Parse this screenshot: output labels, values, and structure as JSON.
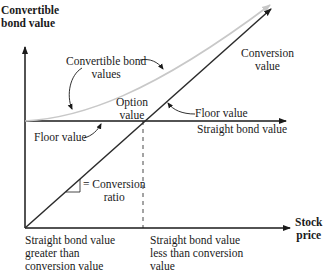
{
  "diagram": {
    "y_axis_label_line1": "Convertible",
    "y_axis_label_line2": "bond value",
    "x_axis_label_line1": "Stock",
    "x_axis_label_line2": "price",
    "curve_label_line1": "Convertible bond",
    "curve_label_line2": "values",
    "conversion_label_line1": "Conversion",
    "conversion_label_line2": "value",
    "option_label_line1": "Option",
    "option_label_line2": "value",
    "floor_left": "Floor value",
    "floor_right": "Floor value",
    "straight_bond": "Straight bond value",
    "ratio_line1": "= Conversion",
    "ratio_line2": "ratio",
    "region_left_line1": "Straight bond value",
    "region_left_line2": "greater than",
    "region_left_line3": "conversion value",
    "region_right_line1": "Straight bond value",
    "region_right_line2": "less than conversion",
    "region_right_line3": "value"
  },
  "colors": {
    "axis": "#1a1a1a",
    "conversion_line": "#2b2b2b",
    "convertible_curve": "#c8c8c8"
  }
}
